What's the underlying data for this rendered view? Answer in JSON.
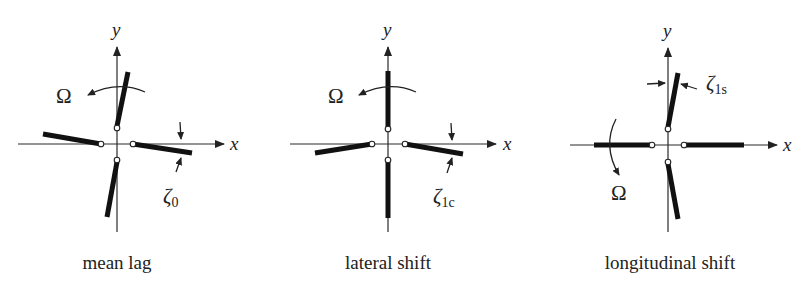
{
  "panels": [
    {
      "id": "mean-lag",
      "caption": "mean lag",
      "x_axis_label": "x",
      "y_axis_label": "y",
      "rotation_label": "Ω",
      "angle_label": "ζ",
      "angle_subscript": "0"
    },
    {
      "id": "lateral-shift",
      "caption": "lateral shift",
      "x_axis_label": "x",
      "y_axis_label": "y",
      "rotation_label": "Ω",
      "angle_label": "ζ",
      "angle_subscript": "1c"
    },
    {
      "id": "longitudinal-shift",
      "caption": "longitudinal shift",
      "x_axis_label": "x",
      "y_axis_label": "y",
      "rotation_label": "Ω",
      "angle_label": "ζ",
      "angle_subscript": "1s"
    }
  ],
  "colors": {
    "ink": "#111111",
    "background": "#ffffff"
  }
}
